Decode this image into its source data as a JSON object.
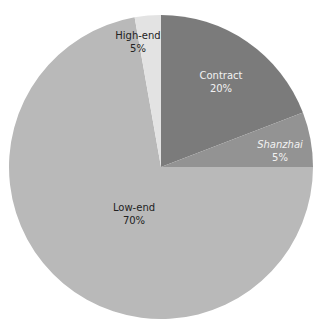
{
  "chart_data": {
    "type": "pie",
    "title": "",
    "slices": [
      {
        "label": "Contract",
        "value": 20,
        "display": "20%",
        "color": "#7b7b7b",
        "start_deg": 0,
        "end_deg": 69
      },
      {
        "label": "Shanzhai",
        "value": 5,
        "display": "5%",
        "color": "#939393",
        "start_deg": 69,
        "end_deg": 90
      },
      {
        "label": "Low-end",
        "value": 70,
        "display": "70%",
        "color": "#b9b9b9",
        "start_deg": 90,
        "end_deg": 350
      },
      {
        "label": "High-end",
        "value": 5,
        "display": "5%",
        "color": "#e3e3e3",
        "start_deg": 350,
        "end_deg": 360
      }
    ],
    "legend": "none",
    "center": [
      161,
      167
    ],
    "radius": 152
  },
  "labels": {
    "contract": {
      "name": "Contract",
      "pct": "20%"
    },
    "shanzhai": {
      "name": "Shanzhai",
      "pct": "5%"
    },
    "low_end": {
      "name": "Low-end",
      "pct": "70%"
    },
    "high_end": {
      "name": "High-end",
      "pct": "5%"
    }
  }
}
